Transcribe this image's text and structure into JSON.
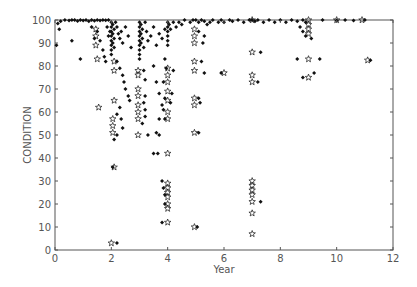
{
  "chart_data": {
    "type": "scatter",
    "title": "",
    "xlabel": "Year",
    "ylabel": "CONDITION",
    "xlim": [
      0,
      12
    ],
    "ylim": [
      0,
      100
    ],
    "xticks": [
      0,
      2,
      4,
      6,
      8,
      10,
      12
    ],
    "yticks": [
      0,
      10,
      20,
      30,
      40,
      50,
      60,
      70,
      80,
      90,
      100
    ],
    "grid": false,
    "legend": null,
    "colors": {
      "axis": "#555555",
      "marker": "#111111",
      "background": "#ffffff"
    },
    "series": [
      {
        "name": "observed",
        "marker": "dot",
        "points": [
          [
            0.1,
            98.5
          ],
          [
            0.2,
            99.5
          ],
          [
            0.35,
            100
          ],
          [
            0.5,
            99.8
          ],
          [
            0.6,
            100
          ],
          [
            0.7,
            100
          ],
          [
            0.8,
            99.6
          ],
          [
            0.9,
            100
          ],
          [
            1.0,
            99.8
          ],
          [
            1.1,
            100
          ],
          [
            1.2,
            99.5
          ],
          [
            1.3,
            100
          ],
          [
            1.4,
            99.7
          ],
          [
            1.5,
            100
          ],
          [
            1.6,
            99.8
          ],
          [
            1.7,
            100
          ],
          [
            1.8,
            99.9
          ],
          [
            1.9,
            100
          ],
          [
            0.15,
            96
          ],
          [
            0.05,
            89
          ],
          [
            0.6,
            91
          ],
          [
            0.9,
            83
          ],
          [
            1.3,
            97
          ],
          [
            1.4,
            92
          ],
          [
            1.5,
            95
          ],
          [
            1.6,
            91
          ],
          [
            1.7,
            87
          ],
          [
            1.75,
            84
          ],
          [
            1.8,
            82
          ],
          [
            1.85,
            97
          ],
          [
            1.9,
            93
          ],
          [
            1.95,
            95
          ],
          [
            2.0,
            99
          ],
          [
            2.0,
            97
          ],
          [
            2.0,
            95
          ],
          [
            2.0,
            93
          ],
          [
            2.0,
            91
          ],
          [
            2.0,
            89
          ],
          [
            2.0,
            87
          ],
          [
            2.0,
            85
          ],
          [
            2.05,
            98
          ],
          [
            2.05,
            94
          ],
          [
            2.05,
            90
          ],
          [
            2.1,
            96
          ],
          [
            2.1,
            92
          ],
          [
            2.1,
            88
          ],
          [
            2.15,
            99
          ],
          [
            2.2,
            97
          ],
          [
            2.25,
            94
          ],
          [
            2.3,
            92
          ],
          [
            2.35,
            95
          ],
          [
            2.4,
            90
          ],
          [
            2.5,
            97
          ],
          [
            2.6,
            93
          ],
          [
            2.7,
            88
          ],
          [
            2.2,
            82
          ],
          [
            2.3,
            79
          ],
          [
            2.4,
            76
          ],
          [
            2.45,
            73
          ],
          [
            2.5,
            70
          ],
          [
            2.6,
            67
          ],
          [
            2.65,
            65
          ],
          [
            2.2,
            59
          ],
          [
            2.3,
            62
          ],
          [
            2.35,
            57
          ],
          [
            2.4,
            53
          ],
          [
            2.2,
            50
          ],
          [
            2.1,
            48
          ],
          [
            2.05,
            36
          ],
          [
            2.2,
            3
          ],
          [
            3.0,
            99
          ],
          [
            3.0,
            97
          ],
          [
            3.0,
            95
          ],
          [
            3.0,
            93
          ],
          [
            3.0,
            91
          ],
          [
            3.0,
            89
          ],
          [
            3.0,
            87
          ],
          [
            3.0,
            85
          ],
          [
            3.0,
            83
          ],
          [
            3.05,
            98
          ],
          [
            3.05,
            94
          ],
          [
            3.05,
            90
          ],
          [
            3.1,
            96
          ],
          [
            3.1,
            92
          ],
          [
            3.15,
            88
          ],
          [
            3.2,
            99
          ],
          [
            3.25,
            95
          ],
          [
            3.3,
            91
          ],
          [
            3.4,
            93
          ],
          [
            3.5,
            97
          ],
          [
            3.6,
            89
          ],
          [
            3.7,
            94
          ],
          [
            3.8,
            92
          ],
          [
            3.9,
            96
          ],
          [
            3.15,
            78
          ],
          [
            3.2,
            74
          ],
          [
            3.2,
            67
          ],
          [
            3.15,
            64
          ],
          [
            3.2,
            61
          ],
          [
            3.2,
            58
          ],
          [
            3.1,
            55
          ],
          [
            3.3,
            50
          ],
          [
            3.5,
            80
          ],
          [
            3.6,
            73
          ],
          [
            3.7,
            68
          ],
          [
            3.8,
            63
          ],
          [
            3.7,
            57
          ],
          [
            3.6,
            51
          ],
          [
            3.5,
            42
          ],
          [
            4.0,
            99
          ],
          [
            4.0,
            97
          ],
          [
            4.0,
            95
          ],
          [
            4.0,
            93
          ],
          [
            4.0,
            91
          ],
          [
            4.0,
            89
          ],
          [
            4.05,
            98
          ],
          [
            4.1,
            96
          ],
          [
            4.2,
            99
          ],
          [
            4.3,
            97
          ],
          [
            4.4,
            99
          ],
          [
            4.5,
            98
          ],
          [
            4.6,
            100
          ],
          [
            4.8,
            99
          ],
          [
            4.9,
            100
          ],
          [
            3.9,
            83
          ],
          [
            3.95,
            79
          ],
          [
            3.85,
            73
          ],
          [
            3.9,
            66
          ],
          [
            3.85,
            61
          ],
          [
            3.9,
            57
          ],
          [
            4.2,
            78
          ],
          [
            4.15,
            68
          ],
          [
            4.1,
            64
          ],
          [
            3.7,
            50
          ],
          [
            3.65,
            42
          ],
          [
            3.8,
            30
          ],
          [
            3.85,
            27
          ],
          [
            3.9,
            24
          ],
          [
            3.9,
            20
          ],
          [
            3.8,
            12
          ],
          [
            5.0,
            100
          ],
          [
            5.1,
            99
          ],
          [
            5.2,
            100
          ],
          [
            5.3,
            99.5
          ],
          [
            5.4,
            98
          ],
          [
            5.5,
            99
          ],
          [
            5.6,
            100
          ],
          [
            5.8,
            99
          ],
          [
            5.9,
            100
          ],
          [
            6.0,
            99
          ],
          [
            6.2,
            100
          ],
          [
            6.3,
            99.5
          ],
          [
            6.5,
            100
          ],
          [
            6.7,
            99
          ],
          [
            6.9,
            100
          ],
          [
            5.1,
            95
          ],
          [
            5.25,
            90
          ],
          [
            5.3,
            93
          ],
          [
            5.2,
            82
          ],
          [
            5.3,
            77
          ],
          [
            5.1,
            66
          ],
          [
            5.15,
            64
          ],
          [
            5.1,
            51
          ],
          [
            5.05,
            10
          ],
          [
            5.9,
            77
          ],
          [
            7.0,
            100
          ],
          [
            7.1,
            99.5
          ],
          [
            7.2,
            100
          ],
          [
            7.4,
            99
          ],
          [
            7.6,
            100
          ],
          [
            7.8,
            99
          ],
          [
            8.0,
            100
          ],
          [
            8.2,
            99
          ],
          [
            8.4,
            100
          ],
          [
            8.6,
            99.5
          ],
          [
            8.8,
            100
          ],
          [
            8.9,
            99
          ],
          [
            7.3,
            86
          ],
          [
            7.2,
            73
          ],
          [
            7.3,
            21
          ],
          [
            8.7,
            97
          ],
          [
            8.8,
            95
          ],
          [
            8.9,
            93
          ],
          [
            9.1,
            92
          ],
          [
            8.6,
            83
          ],
          [
            8.8,
            75
          ],
          [
            9.2,
            77
          ],
          [
            9.4,
            83
          ],
          [
            9.5,
            100
          ],
          [
            10.0,
            99.8
          ],
          [
            10.3,
            100
          ],
          [
            10.6,
            99.8
          ],
          [
            11.0,
            100
          ],
          [
            11.2,
            82.5
          ]
        ]
      },
      {
        "name": "predicted",
        "marker": "star",
        "points": [
          [
            1.45,
            96
          ],
          [
            1.45,
            93
          ],
          [
            1.45,
            89
          ],
          [
            1.5,
            83
          ],
          [
            1.55,
            62
          ],
          [
            2.1,
            82
          ],
          [
            2.1,
            78
          ],
          [
            2.1,
            65
          ],
          [
            2.05,
            57
          ],
          [
            2.05,
            54
          ],
          [
            2.05,
            51
          ],
          [
            2.1,
            36
          ],
          [
            2.0,
            3
          ],
          [
            2.95,
            78
          ],
          [
            2.95,
            76
          ],
          [
            2.95,
            70
          ],
          [
            2.95,
            67
          ],
          [
            2.95,
            63
          ],
          [
            2.95,
            60
          ],
          [
            2.95,
            57
          ],
          [
            2.95,
            50
          ],
          [
            4.0,
            79
          ],
          [
            4.0,
            76
          ],
          [
            4.0,
            73
          ],
          [
            4.0,
            69
          ],
          [
            4.0,
            65
          ],
          [
            4.0,
            60
          ],
          [
            4.0,
            57
          ],
          [
            4.0,
            42
          ],
          [
            4.0,
            29
          ],
          [
            4.0,
            27
          ],
          [
            4.0,
            25
          ],
          [
            4.0,
            23
          ],
          [
            4.0,
            20
          ],
          [
            4.0,
            18
          ],
          [
            4.0,
            12
          ],
          [
            4.95,
            96
          ],
          [
            4.95,
            93
          ],
          [
            4.95,
            90
          ],
          [
            4.95,
            82
          ],
          [
            4.95,
            78
          ],
          [
            4.95,
            66
          ],
          [
            4.95,
            63
          ],
          [
            4.95,
            51
          ],
          [
            4.95,
            10
          ],
          [
            6.0,
            77
          ],
          [
            7.0,
            100
          ],
          [
            7.0,
            86
          ],
          [
            7.0,
            76
          ],
          [
            7.0,
            73
          ],
          [
            7.0,
            30
          ],
          [
            7.0,
            28
          ],
          [
            7.0,
            26
          ],
          [
            7.0,
            24
          ],
          [
            7.0,
            21
          ],
          [
            7.0,
            16
          ],
          [
            7.0,
            7
          ],
          [
            9.0,
            100
          ],
          [
            9.0,
            98
          ],
          [
            9.0,
            96
          ],
          [
            9.0,
            94
          ],
          [
            9.0,
            83
          ],
          [
            9.0,
            75
          ],
          [
            10.0,
            100
          ],
          [
            10.9,
            100
          ],
          [
            11.1,
            82.5
          ]
        ]
      }
    ]
  }
}
